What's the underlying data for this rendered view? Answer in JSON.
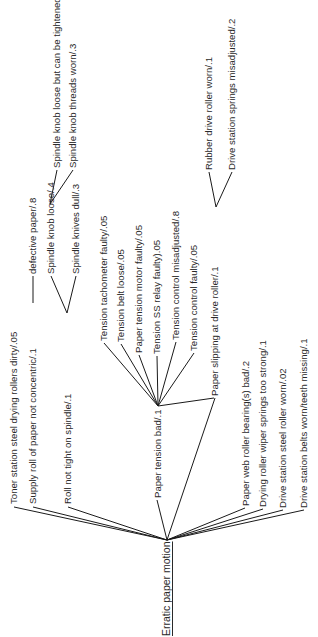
{
  "diagram": {
    "type": "fault-tree",
    "orientation": "rotated -90deg (reads bottom-to-top)",
    "root": {
      "label": "Erratic paper motion"
    },
    "nodes": {
      "toner": {
        "label": "Toner station steel drying rollers dirty/.05"
      },
      "supply": {
        "label": "Supply roll of paper not concentric/.1"
      },
      "defective": {
        "label": "defective paper/.8"
      },
      "roll": {
        "label": "Roll not tight on spindle/.1"
      },
      "knob_loose": {
        "label": "Spindle knob loose/.4"
      },
      "knob_tighten": {
        "label": "Spindle knob loose but can be tightened/.7"
      },
      "knob_threads": {
        "label": "Spindle knob threads worn/.3"
      },
      "knives": {
        "label": "Spindle knives dull/.3"
      },
      "tension": {
        "label": "Paper tension bad/.1"
      },
      "tach": {
        "label": "Tension tachometer faulty/.05"
      },
      "belt": {
        "label": "Tension belt loose/.05"
      },
      "motor": {
        "label": "Paper tension motor faulty/.05"
      },
      "relay": {
        "label": "Tension SS relay faulty).05"
      },
      "misadj": {
        "label": "Tension control misadjusted/.8"
      },
      "ctrl": {
        "label": "Tension control faulty/.05"
      },
      "slipping": {
        "label": "Paper slipping at drive roller/.1"
      },
      "rubber": {
        "label": "Rubber drive roller worn/.1"
      },
      "springs": {
        "label": "Drive station springs misadjusted/.2"
      },
      "bearing": {
        "label": "Paper web roller bearing(s) bad/.2"
      },
      "wiper": {
        "label": "Drying roller wiper springs too strong/.1"
      },
      "steel": {
        "label": "Drive station steel roller worn/.02"
      },
      "belts": {
        "label": "Drive station belts worn/teeth missing/.1"
      }
    },
    "edges": [
      [
        "root",
        "toner"
      ],
      [
        "root",
        "supply"
      ],
      [
        "root",
        "roll"
      ],
      [
        "root",
        "tension"
      ],
      [
        "root",
        "slipping"
      ],
      [
        "root",
        "bearing"
      ],
      [
        "root",
        "wiper"
      ],
      [
        "root",
        "steel"
      ],
      [
        "root",
        "belts"
      ],
      [
        "supply",
        "defective"
      ],
      [
        "roll",
        "knob_loose"
      ],
      [
        "roll",
        "knives"
      ],
      [
        "knob_loose",
        "knob_tighten"
      ],
      [
        "knob_loose",
        "knob_threads"
      ],
      [
        "tension",
        "tach"
      ],
      [
        "tension",
        "belt"
      ],
      [
        "tension",
        "motor"
      ],
      [
        "tension",
        "relay"
      ],
      [
        "tension",
        "misadj"
      ],
      [
        "tension",
        "ctrl"
      ],
      [
        "tension",
        "slipping"
      ],
      [
        "slipping",
        "rubber"
      ],
      [
        "slipping",
        "springs"
      ]
    ]
  }
}
